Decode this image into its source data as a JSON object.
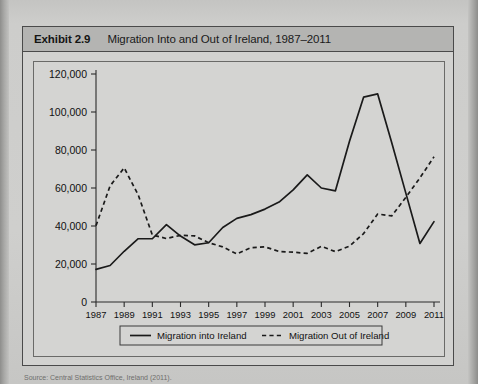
{
  "exhibit": {
    "number_label": "Exhibit 2.9",
    "title": "Migration Into and Out of Ireland, 1987–2011"
  },
  "source_note": "Source: Central Statistics Office, Ireland (2011).",
  "colors": {
    "line": "#1a1a1a",
    "page_background": "#cfcfcd",
    "header_background": "#b4b4b2",
    "frame_border": "#4a4a4a"
  },
  "chart_data": {
    "type": "line",
    "title": "Migration Into and Out of Ireland, 1987–2011",
    "xlabel": "",
    "ylabel": "",
    "ylim": [
      0,
      120000
    ],
    "ytick_labels": [
      "0",
      "20,000",
      "40,000",
      "60,000",
      "80,000",
      "100,000",
      "120,000"
    ],
    "ytick_values": [
      0,
      20000,
      40000,
      60000,
      80000,
      100000,
      120000
    ],
    "xlim": [
      1987,
      2011
    ],
    "xtick_labels": [
      "1987",
      "1989",
      "1991",
      "1993",
      "1995",
      "1997",
      "1999",
      "2001",
      "2003",
      "2005",
      "2007",
      "2009",
      "2011"
    ],
    "xtick_values": [
      1987,
      1989,
      1991,
      1993,
      1995,
      1997,
      1999,
      2001,
      2003,
      2005,
      2007,
      2009,
      2011
    ],
    "x": [
      1987,
      1988,
      1989,
      1990,
      1991,
      1992,
      1993,
      1994,
      1995,
      1996,
      1997,
      1998,
      1999,
      2000,
      2001,
      2002,
      2003,
      2004,
      2005,
      2006,
      2007,
      2008,
      2009,
      2010,
      2011
    ],
    "grid": false,
    "legend_position": "below-axis",
    "series": [
      {
        "name": "Migration into Ireland",
        "style": "solid",
        "values": [
          17200,
          19200,
          26700,
          33300,
          33300,
          40700,
          34700,
          30100,
          31200,
          39200,
          44000,
          46000,
          48900,
          52600,
          59000,
          66900,
          60000,
          58500,
          84600,
          107800,
          109500,
          83800,
          57300,
          30800,
          42300
        ]
      },
      {
        "name": "Migration Out of Ireland",
        "style": "dashed",
        "values": [
          40200,
          61100,
          70600,
          56300,
          35300,
          33400,
          35100,
          34800,
          31200,
          29000,
          25300,
          28600,
          29000,
          26600,
          26200,
          25600,
          29300,
          26500,
          29400,
          36000,
          46300,
          45300,
          55100,
          65300,
          76400
        ]
      }
    ],
    "legend": [
      {
        "label": "Migration into Ireland",
        "style": "solid"
      },
      {
        "label": "Migration Out of Ireland",
        "style": "dashed"
      }
    ]
  }
}
